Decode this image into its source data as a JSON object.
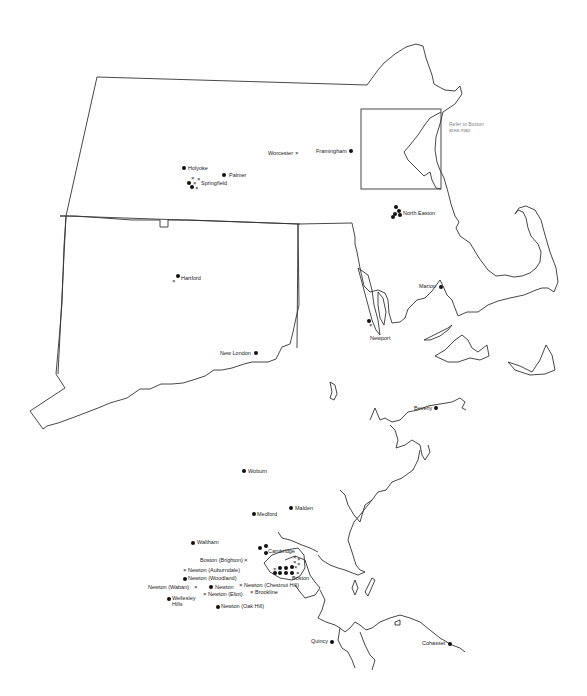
{
  "regional_map": {
    "note": "Refer to Boston area map",
    "places": [
      {
        "name": "Holyoke",
        "x": 183,
        "y": 167
      },
      {
        "name": "Palmer",
        "x": 223,
        "y": 174
      },
      {
        "name": "Springfield",
        "x": 198,
        "y": 186
      },
      {
        "name": "Worcester",
        "x": 268,
        "y": 154
      },
      {
        "name": "Framingham",
        "x": 316,
        "y": 151
      },
      {
        "name": "North Easton",
        "x": 403,
        "y": 214
      },
      {
        "name": "Hartford",
        "x": 181,
        "y": 279
      },
      {
        "name": "Marion",
        "x": 420,
        "y": 287
      },
      {
        "name": "Newport",
        "x": 370,
        "y": 337
      },
      {
        "name": "New London",
        "x": 220,
        "y": 354
      }
    ]
  },
  "boston_map": {
    "places": [
      {
        "name": "Beverly",
        "x": 444,
        "y": 408
      },
      {
        "name": "Woburn",
        "x": 248,
        "y": 472
      },
      {
        "name": "Malden",
        "x": 295,
        "y": 507
      },
      {
        "name": "Medford",
        "x": 257,
        "y": 513
      },
      {
        "name": "Waltham",
        "x": 197,
        "y": 542
      },
      {
        "name": "Cambridge",
        "x": 268,
        "y": 551
      },
      {
        "name": "Boston (Brighton)",
        "x": 200,
        "y": 560
      },
      {
        "name": "Newton (Auburndale)",
        "x": 188,
        "y": 570
      },
      {
        "name": "Newton (Woodland)",
        "x": 188,
        "y": 578
      },
      {
        "name": "Boston",
        "x": 292,
        "y": 577
      },
      {
        "name": "Newton (Waban)",
        "x": 150,
        "y": 586
      },
      {
        "name": "Newton",
        "x": 214,
        "y": 586
      },
      {
        "name": "Newton (Chestnut Hill)",
        "x": 244,
        "y": 584
      },
      {
        "name": "Newton (Eliot)",
        "x": 208,
        "y": 593
      },
      {
        "name": "Brookline",
        "x": 255,
        "y": 591
      },
      {
        "name": "Wellesley Hills",
        "x": 172,
        "y": 598
      },
      {
        "name": "Newton (Oak Hill)",
        "x": 221,
        "y": 605
      },
      {
        "name": "Quincy",
        "x": 311,
        "y": 641
      },
      {
        "name": "Cohasset",
        "x": 422,
        "y": 643
      }
    ]
  },
  "legend_symbols": {
    "dot": "●",
    "cross": "×"
  }
}
